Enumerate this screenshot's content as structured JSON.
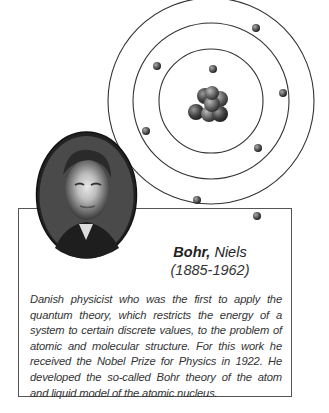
{
  "person": {
    "surname": "Bohr,",
    "given_name": "Niels",
    "dates": "(1885-1962)",
    "description": "Danish physicist who was the first to apply the quantum theory, which restricts the energy of a system to certain discrete values, to the problem of atomic and molecular structure. For this work he received the Nobel Prize for Physics in 1922. He developed the so-called Bohr theory of the atom and liquid model of the atomic nucleus."
  },
  "illustration": {
    "atom_model": "bohr-atom-icon",
    "orbits": 3,
    "electrons": 8,
    "portrait": "portrait-photo"
  }
}
